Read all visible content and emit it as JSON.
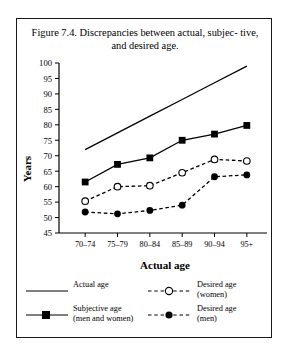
{
  "figure": {
    "title": "Figure 7.4. Discrepancies between actual, subjec-\ntive, and desired age.",
    "border_color": "#1a1a1a"
  },
  "axes": {
    "ylabel": "Years",
    "xlabel": "Actual age",
    "yticks": [
      "45",
      "50",
      "55",
      "60",
      "65",
      "70",
      "75",
      "80",
      "85",
      "90",
      "95",
      "100"
    ],
    "xticks": [
      "70–74",
      "75–79",
      "80–84",
      "85–89",
      "90–94",
      "95+"
    ]
  },
  "legend": {
    "items": [
      {
        "label": "Actual age",
        "key": "solid-line",
        "column": "left"
      },
      {
        "label": "Subjective age\n(men and women)",
        "key": "solid-line-filled-square",
        "column": "left"
      },
      {
        "label": "Desired age\n(women)",
        "key": "dashed-line-open-circle",
        "column": "right"
      },
      {
        "label": "Desired age\n(men)",
        "key": "dashed-line-filled-circle",
        "column": "right"
      }
    ]
  },
  "chart_data": {
    "type": "line",
    "xlabel": "Actual age",
    "ylabel": "Years",
    "categories": [
      "70–74",
      "75–79",
      "80–84",
      "85–89",
      "90–94",
      "95+"
    ],
    "ylim": [
      45,
      100
    ],
    "ytick_step": 5,
    "grid": false,
    "legend_position": "below",
    "series": [
      {
        "name": "Actual age",
        "style": "solid",
        "marker": "none",
        "color": "#000000",
        "values": [
          72.0,
          77.4,
          82.8,
          88.2,
          93.6,
          99.0
        ]
      },
      {
        "name": "Subjective age (men and women)",
        "style": "solid",
        "marker": "filled-square",
        "color": "#000000",
        "values": [
          61.5,
          67.2,
          69.3,
          75.0,
          77.0,
          79.8
        ]
      },
      {
        "name": "Desired age (women)",
        "style": "dashed",
        "marker": "open-circle",
        "color": "#000000",
        "values": [
          55.3,
          60.0,
          60.3,
          64.5,
          68.8,
          68.3
        ]
      },
      {
        "name": "Desired age (men)",
        "style": "dashed",
        "marker": "filled-circle",
        "color": "#000000",
        "values": [
          51.8,
          51.2,
          52.3,
          54.0,
          63.2,
          63.8
        ]
      }
    ]
  }
}
